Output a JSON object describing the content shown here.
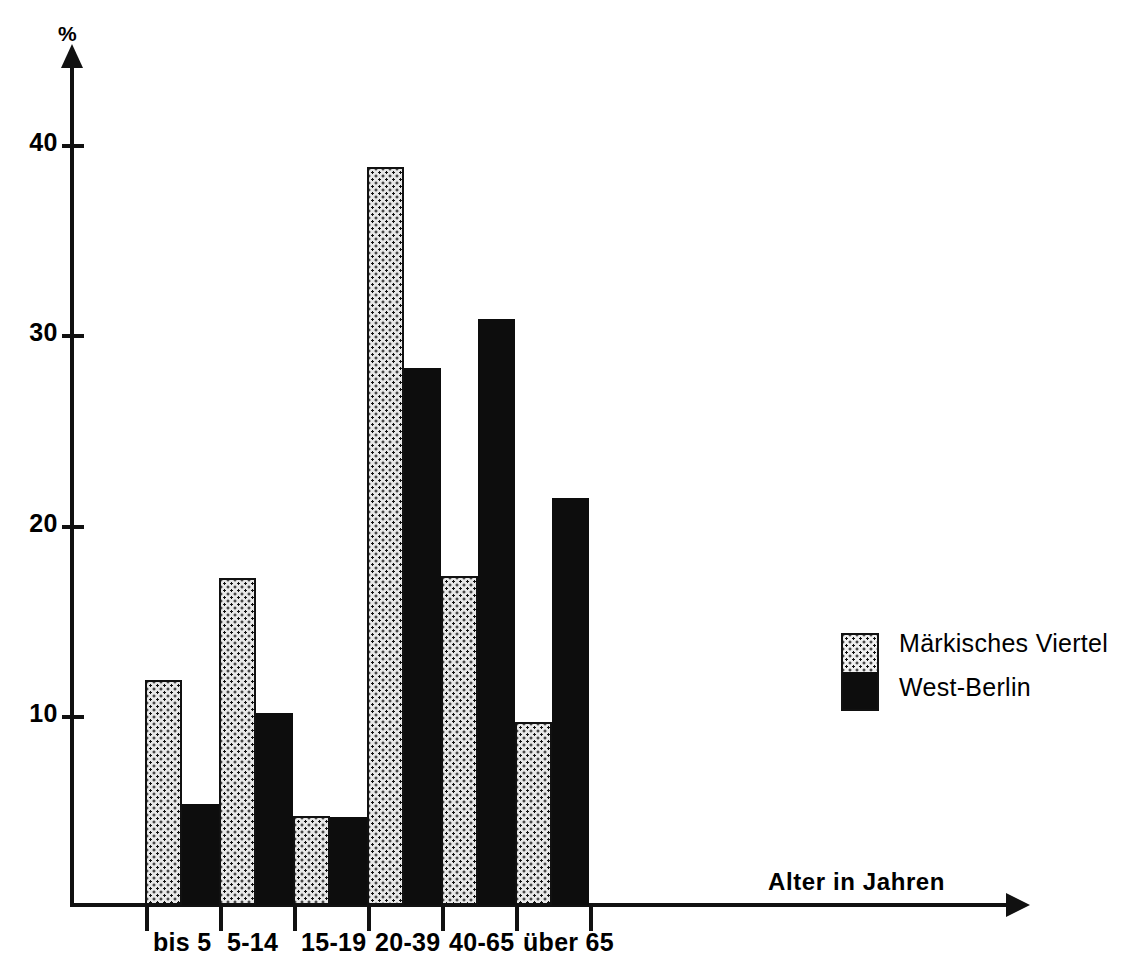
{
  "chart_data": {
    "type": "bar",
    "title": "",
    "xlabel": "Alter in Jahren",
    "ylabel": "%",
    "categories": [
      "bis 5",
      "5-14",
      "15-19",
      "20-39",
      "40-65",
      "über 65"
    ],
    "series": [
      {
        "name": "Märkisches Viertel",
        "values": [
          11.8,
          17.2,
          4.7,
          38.8,
          17.3,
          9.6
        ]
      },
      {
        "name": "West-Berlin",
        "values": [
          5.3,
          10.1,
          4.6,
          28.2,
          30.8,
          21.4
        ]
      }
    ],
    "yticks": [
      10,
      20,
      30,
      40
    ],
    "ylim": [
      0,
      45
    ],
    "grid": false,
    "legend_position": "right"
  },
  "axes": {
    "y_unit_label": "%",
    "y_tick_labels": [
      "40",
      "30",
      "20",
      "10"
    ],
    "x_axis_label": "Alter in Jahren"
  },
  "categories": [
    {
      "label": "bis 5"
    },
    {
      "label": "5-14"
    },
    {
      "label": "15-19"
    },
    {
      "label": "20-39"
    },
    {
      "label": "40-65"
    },
    {
      "label": "über 65"
    }
  ],
  "legend": {
    "entries": [
      {
        "label": "Märkisches Viertel",
        "pattern": "dotted",
        "color": "#e8e8e8"
      },
      {
        "label": "West-Berlin",
        "pattern": "solid",
        "color": "#0d0d0d"
      }
    ]
  },
  "colors": {
    "ink": "#111111",
    "series_markisches_viertel": "#e8e8e8",
    "series_west_berlin": "#0d0d0d",
    "background": "#ffffff"
  }
}
